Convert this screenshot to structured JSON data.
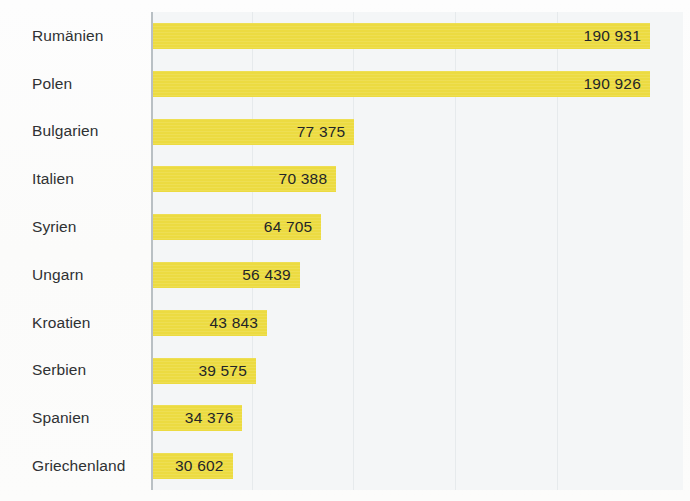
{
  "chart_data": {
    "type": "bar",
    "orientation": "horizontal",
    "title": "",
    "subtitle": "",
    "xlabel": "",
    "ylabel": "",
    "categories": [
      "Rumänien",
      "Polen",
      "Bulgarien",
      "Italien",
      "Syrien",
      "Ungarn",
      "Kroatien",
      "Serbien",
      "Spanien",
      "Griechenland"
    ],
    "values": [
      190931,
      190926,
      77375,
      70388,
      64705,
      56439,
      43843,
      39575,
      34376,
      30602
    ],
    "value_labels": [
      "190 931",
      "190 926",
      "77 375",
      "70 388",
      "64 705",
      "56 439",
      "43 843",
      "39 575",
      "34 376",
      "30 602"
    ],
    "xlim": [
      0,
      190931
    ],
    "tick_labels": [],
    "legend": [],
    "legend_position": "none",
    "grid": {
      "vertical": true,
      "horizontal": false,
      "vertical_positions": [
        252,
        353,
        455,
        557
      ]
    },
    "colors": {
      "bar": "#ECDB41",
      "plot_background": "#F4F6F7",
      "axis_line": "#B9C0C4",
      "label_text": "#2F3133",
      "value_text": "#232528",
      "page_background": "#FFFFFF"
    },
    "bars": [
      {
        "label": "Rumänien",
        "value": 190931,
        "value_label": "190 931"
      },
      {
        "label": "Polen",
        "value": 190926,
        "value_label": "190 926"
      },
      {
        "label": "Bulgarien",
        "value": 77375,
        "value_label": "77 375"
      },
      {
        "label": "Italien",
        "value": 70388,
        "value_label": "70 388"
      },
      {
        "label": "Syrien",
        "value": 64705,
        "value_label": "64 705"
      },
      {
        "label": "Ungarn",
        "value": 56439,
        "value_label": "56 439"
      },
      {
        "label": "Kroatien",
        "value": 43843,
        "value_label": "43 843"
      },
      {
        "label": "Serbien",
        "value": 39575,
        "value_label": "39 575"
      },
      {
        "label": "Spanien",
        "value": 34376,
        "value_label": "34 376"
      },
      {
        "label": "Griechenland",
        "value": 30602,
        "value_label": "30 602"
      }
    ]
  }
}
